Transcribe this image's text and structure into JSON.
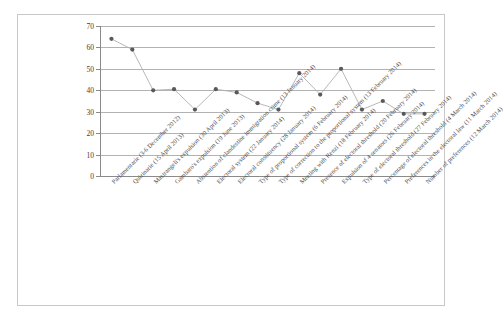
{
  "chart_data": {
    "type": "line",
    "title": "",
    "subtitle": "",
    "xlabel": "",
    "ylabel": "",
    "ylim": [
      0,
      70
    ],
    "yticks": [
      0,
      10,
      20,
      30,
      40,
      50,
      60,
      70
    ],
    "grid": true,
    "legend": "none",
    "marker": "filled-circle",
    "line_color": "#b0b0b0",
    "marker_color": "#595959",
    "categories": [
      "Parlamentarie (3-6 December 2012)",
      "Quirinarie (15 April 2013)",
      "Mastrangeli's expulsion (30 April 2013)",
      "Gambaro's expulsion (19 June 2013)",
      "Abstention of clandestine immigration crime (13 January 2014)",
      "Electoral system (22 January 2014)",
      "Electoral constituency (28 January 2014)",
      "Type of proportional system (6 February 2014)",
      "Type of correction to the proportional system (13 February 2014)",
      "Meeting with Renzi (18 February 2014)",
      "Presence of electoral threshold (20 February 2014)",
      "Expulsion of 4 senators (26 February 2014)",
      "Type of electoral threshold (27 February 2014)",
      "Percentage of electoral threshold (4 March 2014)",
      "Preferences in the electoral law (11 March 2014)",
      "Number of preferences (12 March 2014)"
    ],
    "values": [
      64,
      59,
      40,
      40.5,
      31,
      40.5,
      39,
      34,
      31,
      48,
      38,
      50,
      31,
      35,
      29,
      29
    ]
  }
}
